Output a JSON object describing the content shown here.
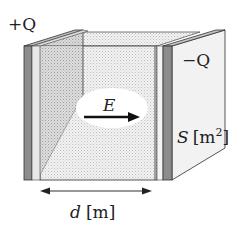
{
  "diagram": {
    "labels": {
      "left_charge": "+Q",
      "right_charge": "−Q",
      "field": "E",
      "area_symbol": "S",
      "area_unit_open": "[m",
      "area_unit_exp": "2",
      "area_unit_close": "]",
      "distance_symbol": "d",
      "distance_unit": "[m]"
    },
    "colors": {
      "plate_edge": "#8c8c8c",
      "plate_face": "#f0f0f0",
      "field_region": "#e4e4e4",
      "outline": "#333333",
      "arrow": "#111111"
    }
  }
}
